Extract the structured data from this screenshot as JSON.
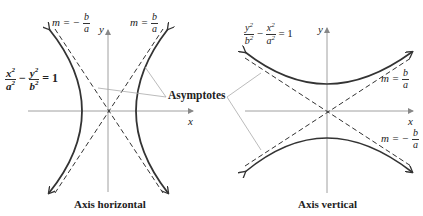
{
  "left_graph": {
    "equation": {
      "num1": "x",
      "den1": "a",
      "exp": "2",
      "minus": "−",
      "num2": "y",
      "den2": "b",
      "rhs": "= 1"
    },
    "slope_neg": {
      "m": "m = −",
      "num": "b",
      "den": "a"
    },
    "slope_pos": {
      "m": "m =",
      "num": "b",
      "den": "a"
    },
    "axis_x": "x",
    "axis_y": "y",
    "caption": "Axis horizontal"
  },
  "right_graph": {
    "equation": {
      "num1": "y",
      "den1": "b",
      "exp": "2",
      "minus": "−",
      "num2": "x",
      "den2": "a",
      "rhs": "= 1"
    },
    "slope_pos": {
      "m": "m =",
      "num": "b",
      "den": "a"
    },
    "slope_neg": {
      "m": "m = −",
      "num": "b",
      "den": "a"
    },
    "axis_x": "x",
    "axis_y": "y",
    "caption": "Axis vertical"
  },
  "shared": {
    "asymptotes_label": "Asymptotes"
  },
  "colors": {
    "curve": "#333333",
    "axis": "#888888",
    "dash": "#333333",
    "pointer": "#aaaaaa"
  }
}
